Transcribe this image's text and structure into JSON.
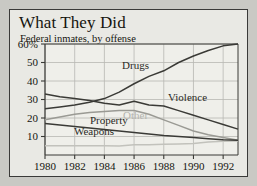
{
  "figure": {
    "title": "What They Did",
    "subtitle": "Federal inmates, by offense",
    "background_color": "#c9c9c4",
    "panel_color": "#e9e9e4",
    "border_color": "#3a3a38"
  },
  "chart_data": {
    "type": "line",
    "title": "What They Did",
    "subtitle": "Federal inmates, by offense",
    "xlabel": "",
    "ylabel": "",
    "xlim": [
      1980,
      1993
    ],
    "ylim": [
      0,
      60
    ],
    "grid": true,
    "legend": "inline-labels",
    "x": [
      1980,
      1981,
      1982,
      1983,
      1984,
      1985,
      1986,
      1987,
      1988,
      1989,
      1990,
      1991,
      1992,
      1993
    ],
    "xticks": [
      "1980",
      "1982",
      "1984",
      "1986",
      "1988",
      "1990",
      "1992"
    ],
    "xtick_values": [
      1980,
      1982,
      1984,
      1986,
      1988,
      1990,
      1992
    ],
    "yticks": [
      "60%",
      "50",
      "40",
      "30",
      "20",
      "10"
    ],
    "ytick_values": [
      60,
      50,
      40,
      30,
      20,
      10
    ],
    "series": [
      {
        "name": "Drugs",
        "label": "Drugs",
        "color": "#3a3a36",
        "label_x": 1986.1,
        "label_y": 46.5,
        "values": [
          25.0,
          26.0,
          27.0,
          28.5,
          30.5,
          34.0,
          38.5,
          42.5,
          45.5,
          50.0,
          53.5,
          56.5,
          59.0,
          60.0
        ]
      },
      {
        "name": "Violence",
        "label": "Violence",
        "color": "#3a3a36",
        "label_x": 1989.6,
        "label_y": 29.0,
        "values": [
          33.0,
          31.5,
          30.5,
          29.5,
          28.0,
          27.0,
          29.0,
          27.0,
          26.5,
          24.0,
          21.5,
          19.0,
          16.5,
          14.0
        ]
      },
      {
        "name": "Property",
        "label": "Property",
        "color": "#9a9a94",
        "label_x": 1984.3,
        "label_y": 17.0,
        "values": [
          19.0,
          20.5,
          22.0,
          23.0,
          23.5,
          24.0,
          24.0,
          22.0,
          19.0,
          16.0,
          13.0,
          11.0,
          9.5,
          8.0
        ]
      },
      {
        "name": "Weapons",
        "label": "Weapons",
        "color": "#3a3a36",
        "label_x": 1983.3,
        "label_y": 11.0,
        "values": [
          17.0,
          16.2,
          15.4,
          14.6,
          13.8,
          13.0,
          12.2,
          11.4,
          10.6,
          10.0,
          9.4,
          8.8,
          8.3,
          8.0
        ]
      },
      {
        "name": "Other",
        "label": "Other",
        "color": "#c2c2bc",
        "label_x": 1986.1,
        "label_y": 19.5,
        "values": [
          5.0,
          5.0,
          5.0,
          5.0,
          5.0,
          4.8,
          5.6,
          5.6,
          5.8,
          6.0,
          6.2,
          7.0,
          7.4,
          7.6
        ]
      }
    ]
  }
}
